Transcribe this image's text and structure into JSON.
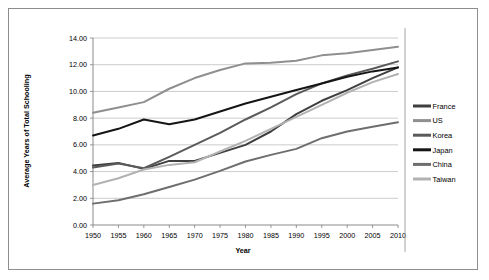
{
  "chart_data": {
    "type": "line",
    "title": "",
    "xlabel": "Year",
    "ylabel": "Average Years of Total Schooling",
    "xlim": [
      1950,
      2010
    ],
    "ylim": [
      0,
      14
    ],
    "ytick_step": 2,
    "grid": true,
    "legend_position": "right",
    "x": [
      1950,
      1955,
      1960,
      1965,
      1970,
      1975,
      1980,
      1985,
      1990,
      1995,
      2000,
      2005,
      2010
    ],
    "xtick_labels": [
      "1950",
      "1955",
      "1960",
      "1965",
      "1970",
      "1975",
      "1980",
      "1985",
      "1990",
      "1995",
      "2000",
      "2005",
      "2010"
    ],
    "ytick_labels": [
      "0.00",
      "2.00",
      "4.00",
      "6.00",
      "8.00",
      "10.00",
      "12.00",
      "14.00"
    ],
    "series": [
      {
        "name": "France",
        "color": "#3f3f3f",
        "values": [
          4.45,
          4.65,
          4.2,
          4.8,
          4.8,
          5.4,
          6.0,
          7.0,
          8.3,
          9.3,
          10.1,
          11.0,
          11.8
        ]
      },
      {
        "name": "US",
        "color": "#8f8f8f",
        "values": [
          8.4,
          8.8,
          9.2,
          10.2,
          11.0,
          11.6,
          12.1,
          12.15,
          12.3,
          12.7,
          12.85,
          13.1,
          13.35
        ]
      },
      {
        "name": "Korea",
        "color": "#5a5a5a",
        "values": [
          4.3,
          4.6,
          4.25,
          5.1,
          6.0,
          6.9,
          7.9,
          8.8,
          9.8,
          10.6,
          11.2,
          11.7,
          12.25
        ]
      },
      {
        "name": "Japan",
        "color": "#151515",
        "values": [
          6.7,
          7.2,
          7.9,
          7.55,
          7.9,
          8.5,
          9.1,
          9.6,
          10.1,
          10.6,
          11.1,
          11.5,
          11.8
        ]
      },
      {
        "name": "China",
        "color": "#6e6e6e",
        "values": [
          1.6,
          1.85,
          2.3,
          2.85,
          3.4,
          4.05,
          4.75,
          5.25,
          5.7,
          6.5,
          7.0,
          7.35,
          7.7
        ]
      },
      {
        "name": "Taiwan",
        "color": "#b2b2b2",
        "values": [
          3.0,
          3.5,
          4.15,
          4.5,
          4.7,
          5.5,
          6.3,
          7.2,
          8.1,
          9.0,
          9.9,
          10.7,
          11.3
        ]
      }
    ]
  },
  "legend": {
    "entries": [
      {
        "label": "France"
      },
      {
        "label": "US"
      },
      {
        "label": "Korea"
      },
      {
        "label": "Japan"
      },
      {
        "label": "China"
      },
      {
        "label": "Taiwan"
      }
    ]
  }
}
